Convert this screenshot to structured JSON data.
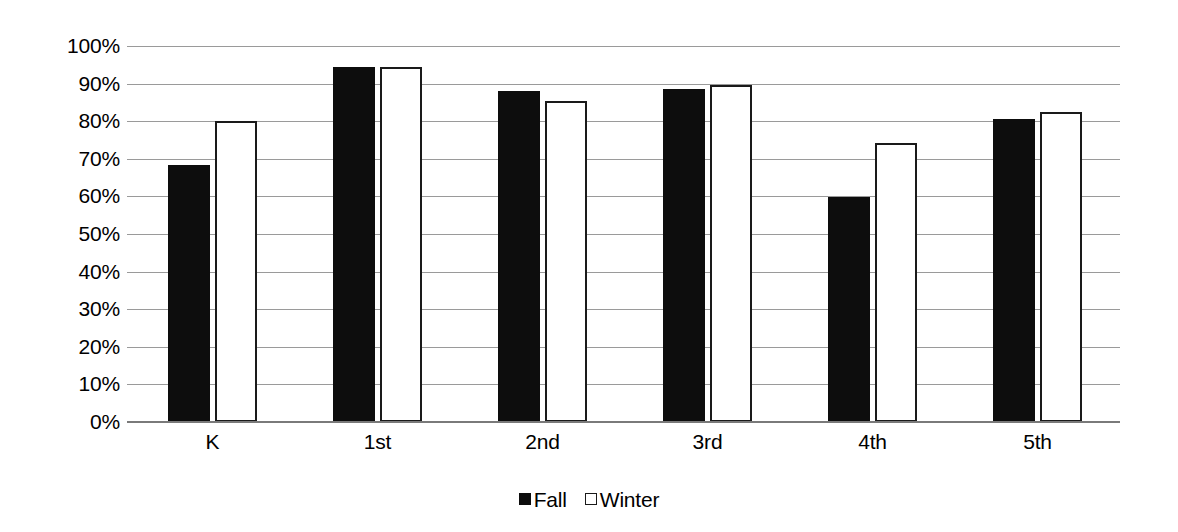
{
  "chart_data": {
    "type": "bar",
    "title": "",
    "subtitle": "",
    "xlabel": "",
    "ylabel": "",
    "categories": [
      "K",
      "1st",
      "2nd",
      "3rd",
      "4th",
      "5th"
    ],
    "series": [
      {
        "name": "Fall",
        "values": [
          68.4,
          94.4,
          88.0,
          88.6,
          59.8,
          80.6
        ],
        "color": "#0d0d0d",
        "style": "filled"
      },
      {
        "name": "Winter",
        "values": [
          80.0,
          94.4,
          85.4,
          89.6,
          74.2,
          82.4
        ],
        "color": "#ffffff",
        "style": "outlined"
      }
    ],
    "ylim": [
      0,
      100
    ],
    "ytick_values": [
      0,
      10,
      20,
      30,
      40,
      50,
      60,
      70,
      80,
      90,
      100
    ],
    "ytick_labels": [
      "0%",
      "10%",
      "20%",
      "30%",
      "40%",
      "50%",
      "60%",
      "70%",
      "80%",
      "90%",
      "100%"
    ],
    "grid": true,
    "grid_axis": "y",
    "legend_position": "bottom",
    "legend_entries": [
      "Fall",
      "Winter"
    ],
    "annotations": []
  },
  "colors": {
    "background": "#ffffff",
    "gridline": "#9a9a9a",
    "axis": "#7a7a7a",
    "fall_fill": "#0d0d0d",
    "winter_fill": "#ffffff",
    "winter_stroke": "#1a1a1a",
    "text": "#000000"
  }
}
